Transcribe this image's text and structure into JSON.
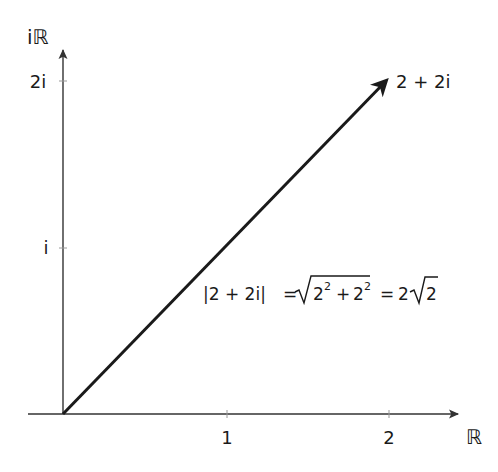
{
  "diagram": {
    "title": "",
    "axes": {
      "x_label": "ℝ",
      "y_label": "iℝ",
      "x_ticks": [
        {
          "value": 1,
          "label": "1"
        },
        {
          "value": 2,
          "label": "2"
        }
      ],
      "y_ticks": [
        {
          "value": 1,
          "label": "i"
        },
        {
          "value": 2,
          "label": "2i"
        }
      ]
    },
    "vector": {
      "from": [
        0,
        0
      ],
      "to": [
        2,
        2
      ],
      "label": "2 + 2i"
    },
    "equation": {
      "lhs": "|2 + 2i|",
      "eq1": "=",
      "sqrt_content_a": "2",
      "sqrt_content_a_exp": "2",
      "plus": "+",
      "sqrt_content_b": "2",
      "sqrt_content_b_exp": "2",
      "eq2": "=",
      "result_coef": "2",
      "result_root": "2",
      "full_text": "|2 + 2i| = √(2² + 2²) = 2√2"
    },
    "colors": {
      "axis": "#333333",
      "vector": "#1a1a1a",
      "text": "#1a1a1a",
      "background": "#ffffff"
    }
  }
}
